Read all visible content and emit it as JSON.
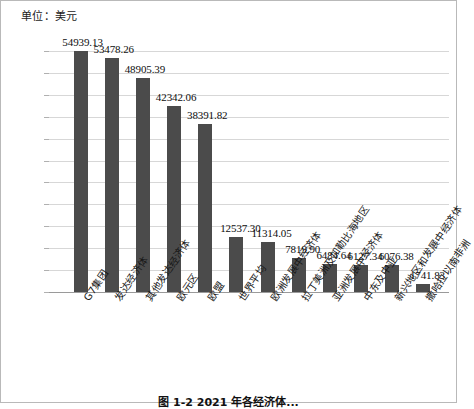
{
  "unit_label": "单位：美元",
  "caption": "图 1-2    2021 年各经济体...",
  "colors": {
    "bar": "#4b4b4b",
    "gridline": "#d7d7d7",
    "axis": "#9a9a9a",
    "text": "#111111",
    "frame": "#b9b9b9"
  },
  "chart_data": {
    "type": "bar",
    "title": "",
    "subtitle": "",
    "xlabel": "",
    "ylabel": "单位：美元",
    "ylim": [
      0,
      55000
    ],
    "ytick_step": 5000,
    "grid": true,
    "legend": "none",
    "yticks": [
      "0",
      "5000",
      "10000",
      "15000",
      "20000",
      "25000",
      "30000",
      "35000",
      "40000",
      "45000",
      "50000",
      "55000"
    ],
    "categories": [
      "G7集团",
      "发达经济体",
      "其他发达经济体",
      "欧元区",
      "欧盟",
      "世界平均",
      "欧洲发展中经济体",
      "拉丁美洲及加勒比海地区",
      "亚洲发展中经济体",
      "中东及中亚",
      "新兴地区和发展中经济体",
      "撒哈拉以南非洲"
    ],
    "values": [
      54939.13,
      53478.26,
      48905.39,
      42342.06,
      38391.82,
      12537.3,
      11314.05,
      7819.9,
      6484.64,
      6127.34,
      6076.38,
      1741.83
    ],
    "value_labels": [
      "54939.13",
      "53478.26",
      "48905.39",
      "42342.06",
      "38391.82",
      "12537.30",
      "11314.05",
      "7819.90",
      "6484.64",
      "6127.34",
      "6076.38",
      "1741.83"
    ]
  }
}
